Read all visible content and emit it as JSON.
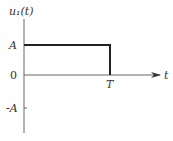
{
  "figure": {
    "y_label": "u₁(t)",
    "x_label": "t",
    "y_ticks": {
      "A": "A",
      "zero": "0",
      "neg_A": "-A"
    },
    "x_tick_T": "T"
  },
  "signal": {
    "type": "rectangular pulse",
    "amplitude": "A",
    "start": "0",
    "end": "T"
  },
  "colors": {
    "axis": "#555555",
    "signal": "#222222",
    "text": "#333333"
  }
}
